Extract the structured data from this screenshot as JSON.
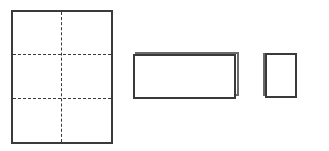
{
  "diagram": {
    "steps": [
      {
        "name": "flat-sheet",
        "grid": {
          "cols": 2,
          "rows": 3
        },
        "fold_lines": "dashed"
      },
      {
        "name": "folded-strip",
        "layers": 2
      },
      {
        "name": "folded-square",
        "layers": 2
      }
    ],
    "colors": {
      "line": "#3a3a3a",
      "background": "#ffffff"
    }
  }
}
